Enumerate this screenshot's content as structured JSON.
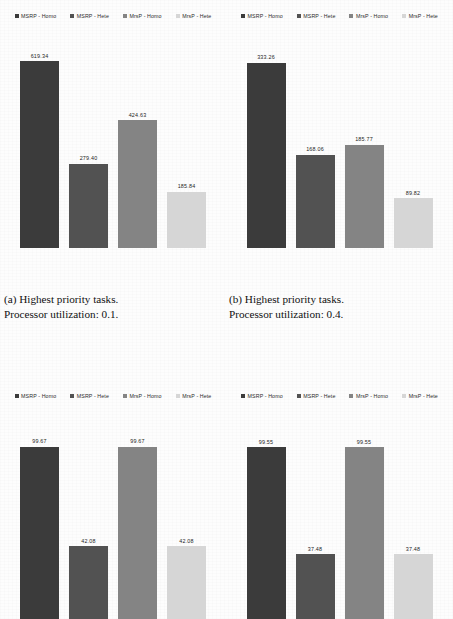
{
  "figure": {
    "legend": [
      {
        "label": "MSRP - Homo",
        "color": "#3b3b3b"
      },
      {
        "label": "MSRP - Hete",
        "color": "#525252"
      },
      {
        "label": "MrsP - Homo",
        "color": "#848484"
      },
      {
        "label": "MrsP - Hete",
        "color": "#d6d6d6"
      }
    ],
    "captions": {
      "a": {
        "line1": "(a) Highest priority tasks.",
        "line2": "Processor utilization: 0.1."
      },
      "b": {
        "line1": "(b) Highest priority tasks.",
        "line2": "Processor utilization: 0.4."
      }
    }
  },
  "chart_data": [
    {
      "type": "bar",
      "panel": "a",
      "title": "(a) Highest priority tasks. Processor utilization: 0.1.",
      "categories": [
        "MSRP - Homo",
        "MSRP - Hete",
        "MrsP - Homo",
        "MrsP - Hete"
      ],
      "values": [
        619.34,
        279.4,
        424.63,
        185.84
      ],
      "labels": [
        "619.34",
        "279.40",
        "424.63",
        "185.84"
      ],
      "colors": [
        "#3b3b3b",
        "#525252",
        "#848484",
        "#d6d6d6"
      ],
      "xlabel": "",
      "ylabel": "",
      "ylim": [
        0,
        700
      ],
      "grid": false,
      "legend_position": "top",
      "axis_visible": false
    },
    {
      "type": "bar",
      "panel": "b",
      "title": "(b) Highest priority tasks. Processor utilization: 0.4.",
      "categories": [
        "MSRP - Homo",
        "MSRP - Hete",
        "MrsP - Homo",
        "MrsP - Hete"
      ],
      "values": [
        333.26,
        168.06,
        185.77,
        89.82
      ],
      "labels": [
        "333.26",
        "168.06",
        "185.77",
        "89.82"
      ],
      "colors": [
        "#3b3b3b",
        "#525252",
        "#848484",
        "#d6d6d6"
      ],
      "xlabel": "",
      "ylabel": "",
      "ylim": [
        0,
        380
      ],
      "grid": false,
      "legend_position": "top",
      "axis_visible": false
    },
    {
      "type": "bar",
      "panel": "c",
      "title": "",
      "categories": [
        "MSRP - Homo",
        "MSRP - Hete",
        "MrsP - Homo",
        "MrsP - Hete"
      ],
      "values": [
        99.67,
        42.08,
        99.67,
        42.08
      ],
      "labels": [
        "99.67",
        "42.08",
        "99.67",
        "42.08"
      ],
      "colors": [
        "#3b3b3b",
        "#525252",
        "#848484",
        "#d6d6d6"
      ],
      "xlabel": "",
      "ylabel": "",
      "ylim": [
        0,
        110
      ],
      "grid": false,
      "legend_position": "top",
      "axis_visible": false,
      "note": "bars clipped by bottom image edge"
    },
    {
      "type": "bar",
      "panel": "d",
      "title": "",
      "categories": [
        "MSRP - Homo",
        "MSRP - Hete",
        "MrsP - Homo",
        "MrsP - Hete"
      ],
      "values": [
        99.55,
        37.48,
        99.55,
        37.48
      ],
      "labels": [
        "99.55",
        "37.48",
        "99.55",
        "37.48"
      ],
      "colors": [
        "#3b3b3b",
        "#525252",
        "#848484",
        "#d6d6d6"
      ],
      "xlabel": "",
      "ylabel": "",
      "ylim": [
        0,
        110
      ],
      "grid": false,
      "legend_position": "top",
      "axis_visible": false,
      "note": "bars clipped by bottom image edge"
    }
  ]
}
